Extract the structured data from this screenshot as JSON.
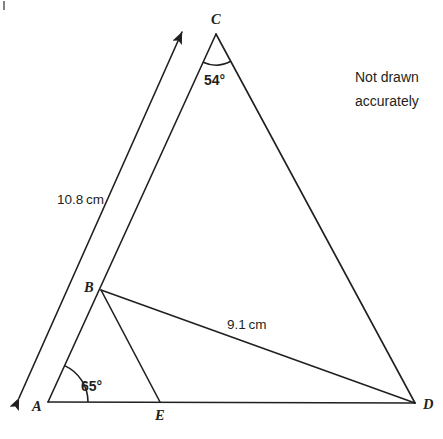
{
  "figure": {
    "kind": "geometry-diagram",
    "note_line1": "Not drawn",
    "note_line2": "accurately",
    "stroke_color": "#231f20",
    "background_color": "#ffffff"
  },
  "vertices": {
    "A": {
      "label": "A",
      "x": 48,
      "y": 402,
      "label_x": 32,
      "label_y": 411
    },
    "B": {
      "label": "B",
      "x": 101,
      "y": 290,
      "label_x": 84,
      "label_y": 292
    },
    "C": {
      "label": "C",
      "x": 216,
      "y": 34,
      "label_x": 211,
      "label_y": 24
    },
    "D": {
      "label": "D",
      "x": 415,
      "y": 403,
      "label_x": 423,
      "label_y": 409
    },
    "E": {
      "label": "E",
      "x": 160,
      "y": 402,
      "label_x": 155,
      "label_y": 420
    }
  },
  "segments": [
    {
      "name": "A-C",
      "from": "A",
      "to": "C"
    },
    {
      "name": "C-D",
      "from": "C",
      "to": "D"
    },
    {
      "name": "A-D",
      "from": "A",
      "to": "D"
    },
    {
      "name": "B-D",
      "from": "B",
      "to": "D"
    },
    {
      "name": "B-E",
      "from": "B",
      "to": "E"
    }
  ],
  "ray": {
    "name": "double-headed-ray",
    "x1": 19,
    "y1": 398,
    "x2": 182,
    "y2": 32
  },
  "measurements": [
    {
      "name": "length-AC",
      "text": "10.8 cm",
      "x": 57,
      "y": 204
    },
    {
      "name": "length-BD",
      "text": "9.1 cm",
      "x": 227,
      "y": 329
    }
  ],
  "angles": [
    {
      "name": "angle-at-C",
      "text": "54°",
      "x": 204,
      "y": 85,
      "vertex": "C",
      "radius": 31
    },
    {
      "name": "angle-at-A",
      "text": "65°",
      "x": 81,
      "y": 391,
      "vertex": "A",
      "radius": 40
    }
  ]
}
